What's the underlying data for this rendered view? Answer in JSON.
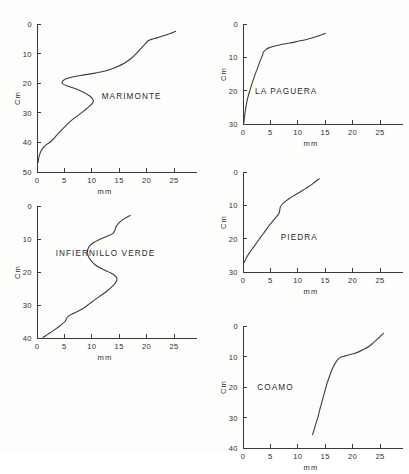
{
  "figure": {
    "background_color": "#fdfdfb",
    "line_color": "#3d3d3d",
    "axis_color": "#3a3a3a"
  },
  "chart_data": [
    {
      "type": "line",
      "title": "MARIMONTE",
      "xlabel": "mm",
      "ylabel": "Cm",
      "xlim": [
        0,
        27
      ],
      "ylim": [
        50,
        0
      ],
      "xticks": [
        0,
        5,
        10,
        15,
        20,
        25
      ],
      "yticks": [
        0,
        10,
        20,
        30,
        40,
        50
      ],
      "grid": false,
      "legend": "none",
      "x": [
        0.2,
        0.35,
        0.7,
        1.3,
        2.0,
        2.6,
        3.3,
        4.6,
        6.4,
        8.4,
        9.8,
        10.3,
        9.7,
        8.0,
        6.0,
        4.8,
        4.6,
        5.2,
        6.6,
        8.6,
        10.6,
        12.6,
        14.4,
        16.0,
        17.3,
        18.3,
        19.2,
        19.9,
        20.3,
        20.9,
        22.0,
        23.4,
        24.6,
        25.3
      ],
      "y": [
        46.8,
        45.0,
        43.0,
        41.4,
        40.4,
        39.6,
        38.2,
        35.6,
        32.4,
        29.6,
        27.4,
        26.0,
        24.4,
        22.6,
        21.2,
        20.4,
        19.6,
        18.6,
        17.8,
        17.2,
        16.6,
        15.8,
        14.6,
        13.2,
        11.4,
        9.6,
        7.8,
        6.4,
        5.6,
        5.2,
        4.6,
        3.8,
        3.0,
        2.5
      ]
    },
    {
      "type": "line",
      "title": "INFIERNILLO   VERDE",
      "xlabel": "mm",
      "ylabel": "Cm",
      "xlim": [
        0,
        27
      ],
      "ylim": [
        40,
        0
      ],
      "xticks": [
        0,
        5,
        10,
        15,
        20,
        25
      ],
      "yticks": [
        0,
        10,
        20,
        30,
        40
      ],
      "grid": false,
      "legend": "none",
      "x": [
        1.1,
        1.6,
        2.4,
        3.3,
        4.2,
        5.1,
        5.6,
        6.6,
        7.8,
        8.8,
        9.6,
        10.4,
        11.4,
        12.6,
        13.6,
        14.3,
        14.6,
        14.3,
        13.4,
        12.0,
        10.6,
        9.6,
        9.2,
        9.4,
        10.2,
        11.6,
        13.0,
        13.9,
        14.2,
        14.4,
        14.9,
        15.6,
        16.4,
        17.0
      ],
      "y": [
        39.8,
        39.3,
        38.4,
        37.4,
        36.3,
        35.0,
        33.6,
        32.6,
        31.6,
        30.6,
        29.6,
        28.6,
        27.4,
        26.0,
        24.6,
        23.3,
        22.2,
        21.2,
        20.2,
        19.2,
        17.8,
        16.0,
        14.2,
        12.6,
        11.2,
        10.0,
        9.0,
        8.2,
        7.4,
        6.4,
        5.2,
        4.2,
        3.4,
        2.9
      ]
    },
    {
      "type": "line",
      "title": "LA   PAGUERA",
      "xlabel": "mm",
      "ylabel": "Cm",
      "xlim": [
        0,
        27
      ],
      "ylim": [
        30,
        0
      ],
      "xticks": [
        0,
        5,
        10,
        15,
        20,
        25
      ],
      "yticks": [
        0,
        10,
        20,
        30
      ],
      "grid": false,
      "legend": "none",
      "x": [
        0.15,
        0.3,
        0.5,
        0.8,
        1.2,
        1.7,
        2.2,
        2.7,
        3.1,
        3.4,
        3.6,
        3.7,
        4.2,
        5.0,
        6.0,
        7.2,
        8.6,
        10.0,
        11.4,
        12.6,
        13.6,
        14.2,
        14.7,
        15.0
      ],
      "y": [
        29.7,
        27.6,
        25.2,
        22.6,
        20.2,
        17.6,
        15.2,
        13.0,
        11.2,
        10.0,
        9.2,
        8.5,
        7.6,
        7.0,
        6.5,
        6.1,
        5.7,
        5.2,
        4.7,
        4.2,
        3.7,
        3.3,
        3.0,
        2.8
      ]
    },
    {
      "type": "line",
      "title": "PIEDRA",
      "xlabel": "mm",
      "ylabel": "Cm",
      "xlim": [
        0,
        27
      ],
      "ylim": [
        30,
        0
      ],
      "xticks": [
        0,
        5,
        10,
        15,
        20,
        25
      ],
      "yticks": [
        0,
        10,
        20,
        30
      ],
      "grid": false,
      "legend": "none",
      "x": [
        0.2,
        0.6,
        1.2,
        1.9,
        2.6,
        3.3,
        4.0,
        4.7,
        5.4,
        6.0,
        6.5,
        6.7,
        6.8,
        7.2,
        7.9,
        8.6,
        9.4,
        10.2,
        11.0,
        11.8,
        12.5,
        13.1,
        13.6,
        13.9
      ],
      "y": [
        27.2,
        25.8,
        24.2,
        22.6,
        21.0,
        19.4,
        17.8,
        16.2,
        14.8,
        13.6,
        12.6,
        11.6,
        10.6,
        9.6,
        8.6,
        7.8,
        7.0,
        6.2,
        5.4,
        4.6,
        3.8,
        3.0,
        2.4,
        2.0
      ]
    },
    {
      "type": "line",
      "title": "COAMO",
      "xlabel": "mm",
      "ylabel": "Cm",
      "xlim": [
        0,
        27
      ],
      "ylim": [
        40,
        0
      ],
      "xticks": [
        0,
        5,
        10,
        15,
        20,
        25
      ],
      "yticks": [
        0,
        10,
        20,
        30,
        40
      ],
      "grid": false,
      "legend": "none",
      "x": [
        12.7,
        13.2,
        13.7,
        14.1,
        14.5,
        14.9,
        15.3,
        15.8,
        16.3,
        16.9,
        17.4,
        17.9,
        18.6,
        19.4,
        20.3,
        21.2,
        22.1,
        22.9,
        23.6,
        24.2,
        24.8,
        25.2,
        25.5,
        25.6
      ],
      "y": [
        35.6,
        32.6,
        29.6,
        26.8,
        24.2,
        21.6,
        19.0,
        16.4,
        14.0,
        12.0,
        10.8,
        10.2,
        9.8,
        9.4,
        9.0,
        8.4,
        7.6,
        6.8,
        5.8,
        4.8,
        3.8,
        3.1,
        2.6,
        2.4
      ]
    }
  ],
  "panels": [
    {
      "name": "marimonte",
      "label": "MARIMONTE",
      "label_x": 11.8,
      "label_y": 25.4,
      "x_axis_title": "mm",
      "y_axis_title": "Cm",
      "x_tick_labels": [
        "0",
        "5",
        "10",
        "15",
        "20",
        "25"
      ],
      "y_tick_labels": [
        "0",
        "10",
        "20",
        "30",
        "40",
        "50"
      ]
    },
    {
      "name": "infiernillo-verde",
      "label": "INFIERNILLO   VERDE",
      "label_x": 3.4,
      "label_y": 15.2,
      "x_axis_title": "mm",
      "y_axis_title": "Cm",
      "x_tick_labels": [
        "0",
        "5",
        "10",
        "15",
        "20",
        "25"
      ],
      "y_tick_labels": [
        "0",
        "10",
        "20",
        "30",
        "40"
      ]
    },
    {
      "name": "la-paguera",
      "label": "LA   PAGUERA",
      "label_x": 2.2,
      "label_y": 21.0,
      "x_axis_title": "mm",
      "y_axis_title": "Cm",
      "x_tick_labels": [
        "0",
        "5",
        "10",
        "15",
        "20",
        "25"
      ],
      "y_tick_labels": [
        "0",
        "10",
        "20",
        "30"
      ]
    },
    {
      "name": "piedra",
      "label": "PIEDRA",
      "label_x": 6.9,
      "label_y": 20.4,
      "x_axis_title": "mm",
      "y_axis_title": "Cm",
      "x_tick_labels": [
        "0",
        "5",
        "10",
        "15",
        "20",
        "25"
      ],
      "y_tick_labels": [
        "0",
        "10",
        "20",
        "30"
      ]
    },
    {
      "name": "coamo",
      "label": "COAMO",
      "label_x": 2.6,
      "label_y": 21.0,
      "x_axis_title": "mm",
      "y_axis_title": "Cm",
      "x_tick_labels": [
        "0",
        "5",
        "10",
        "15",
        "20",
        "25"
      ],
      "y_tick_labels": [
        "0",
        "10",
        "20",
        "30",
        "40"
      ]
    }
  ]
}
